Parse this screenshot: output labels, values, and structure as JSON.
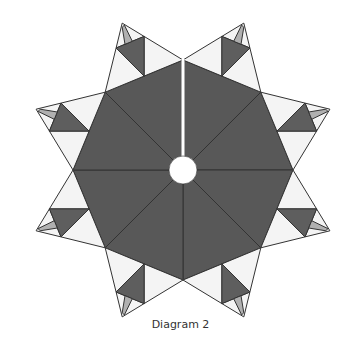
{
  "figure": {
    "caption": "Diagram 2",
    "center": [
      183,
      170
    ],
    "valley_radius": 110,
    "tip_radius": 159,
    "hole_radius": 14,
    "slit_width": 3,
    "point_count": 8,
    "inner_fraction": 0.64
  },
  "colors": {
    "background": "#ffffff",
    "octagon": "#585858",
    "dark_triangle": "#5e5e5e",
    "light_triangle": "#f4f4f4",
    "sliver": "#b0b0b0",
    "stroke": "#333333",
    "hole": "#ffffff",
    "caption": "#333333"
  }
}
